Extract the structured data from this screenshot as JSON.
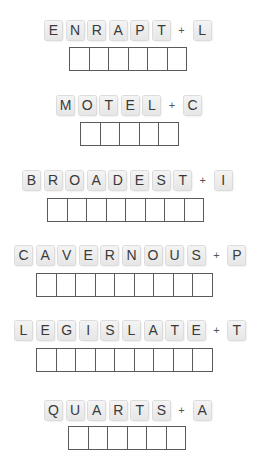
{
  "puzzles": [
    {
      "word": "ENRAPT",
      "plus": "+",
      "extra": "L",
      "answer_length": 6,
      "tiles_x": 45,
      "tiles_y": 20,
      "boxes_x": 69,
      "boxes_y": 47
    },
    {
      "word": "MOTEL",
      "plus": "+",
      "extra": "C",
      "answer_length": 5,
      "tiles_x": 57,
      "tiles_y": 95,
      "boxes_x": 80,
      "boxes_y": 122
    },
    {
      "word": "BROADEST",
      "plus": "+",
      "extra": "I",
      "answer_length": 8,
      "tiles_x": 23,
      "tiles_y": 170,
      "boxes_x": 47,
      "boxes_y": 198
    },
    {
      "word": "CAVERNOUS",
      "plus": "+",
      "extra": "P",
      "answer_length": 9,
      "tiles_x": 15,
      "tiles_y": 245,
      "boxes_x": 36,
      "boxes_y": 273
    },
    {
      "word": "LEGISLATE",
      "plus": "+",
      "extra": "T",
      "answer_length": 9,
      "tiles_x": 15,
      "tiles_y": 320,
      "boxes_x": 36,
      "boxes_y": 348
    },
    {
      "word": "QUARTS",
      "plus": "+",
      "extra": "A",
      "answer_length": 6,
      "tiles_x": 45,
      "tiles_y": 400,
      "boxes_x": 68,
      "boxes_y": 426
    }
  ]
}
